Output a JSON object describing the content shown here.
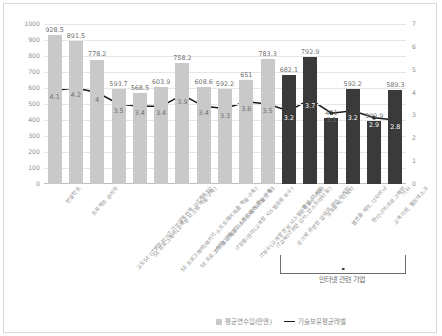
{
  "chart_data": {
    "type": "bar",
    "title": "",
    "xlabel": "",
    "ylabel": "",
    "grid": true,
    "legend_position": "bottom-right",
    "categories": [
      "컨설턴트",
      "프로젝트 관리자",
      "고도SE (IT명장치·IoT·기반설계연계, IoT계측팀)",
      "SE 프로그래머(고객향 시스템 개발·구축)",
      "SE 프로그래머(패키지·소프트웨어제품 개발·구축)",
      "SE 프로그래머(임베디드·소프트웨어 개발·구축)",
      "IT기술 스페셜리스트(DB/NW/보안 등)",
      "IT운용/관리(고객향 시스템운용·보수)",
      "IT보수(고객향 정보 시스템운용보수·지원)",
      "IT교육(IT관련 감사, 인스트럭터 등)",
      "상기외 관련된 업무의 영업·마케팅",
      "영업, 마케팅",
      "프로듀서, 디렉터",
      "웹연출·제작, 디자이너",
      "엔지니어/프로그래머",
      "고객지원, 헬프데스크",
      "기타"
    ],
    "y_left": {
      "ticks": [
        0,
        100,
        200,
        300,
        400,
        500,
        600,
        700,
        800,
        900,
        1000
      ],
      "ylim": [
        0,
        1000
      ]
    },
    "y_right": {
      "ticks": [
        0,
        1,
        2,
        3,
        4,
        5,
        6,
        7
      ],
      "ylim": [
        0,
        7
      ]
    },
    "series": [
      {
        "name": "평균연수입(만엔)",
        "type": "bar",
        "axis": "left",
        "color": "#c9c9c9",
        "highlight_color": "#3a3a3a",
        "values": [
          928.5,
          891.5,
          778.2,
          593.7,
          568.5,
          603.9,
          758.2,
          608.6,
          592.2,
          651,
          783.3,
          682.1,
          792.9,
          411,
          592.2,
          390.9,
          589.3
        ],
        "labels": [
          "928.5",
          "891.5",
          "778.2",
          "593.7",
          "568.5",
          "603.9",
          "758.2",
          "608.6",
          "592.2",
          "651",
          "783.3",
          "682.1",
          "792.9",
          "411",
          "592.2",
          "390.9",
          "589.3"
        ],
        "dark_from_index": 11
      },
      {
        "name": "기술보유평균레벨",
        "type": "line",
        "axis": "right",
        "color": "#1a1a1a",
        "values": [
          4.1,
          4.2,
          4,
          3.5,
          3.4,
          3.4,
          3.9,
          3.4,
          3.3,
          3.6,
          3.5,
          3.2,
          3.7,
          3.1,
          3.2,
          2.9,
          2.8
        ],
        "labels": [
          "4.1",
          "4.2",
          "4",
          "3.5",
          "3.4",
          "3.4",
          "3.9",
          "3.4",
          "3.3",
          "3.6",
          "3.5",
          "3.2",
          "3.7",
          "3.1",
          "3.2",
          "2.9",
          "2.8"
        ]
      }
    ],
    "annotation": {
      "bracket_caption": "인터넷 관련 기업",
      "bracket_start_index": 11,
      "bracket_end_index": 16
    }
  }
}
